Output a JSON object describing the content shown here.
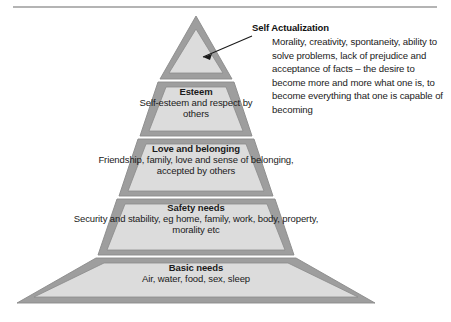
{
  "diagram": {
    "type": "maslow-hierarchy-of-needs-pyramid",
    "colors": {
      "frame": "#9e9e9e",
      "fill": "#dcdcdc",
      "outline": "#8a8a8a",
      "text": "#1a1a1a",
      "rule": "#b4b4b4",
      "background": "#ffffff"
    }
  },
  "callout": {
    "title": "Self Actualization",
    "body": "Morality, creativity, spontaneity, ability to solve problems, lack of prejudice and acceptance of facts – the desire to become more and more what one is, to become everything that one is capable of becoming"
  },
  "tiers": [
    {
      "id": "self-actualization",
      "level": 5,
      "title": "",
      "description": ""
    },
    {
      "id": "esteem",
      "level": 4,
      "title": "Esteem",
      "description": "Self-esteem and respect by others"
    },
    {
      "id": "love-and-belonging",
      "level": 3,
      "title": "Love and belonging",
      "description": "Friendship, family, love and sense of belonging, accepted by others"
    },
    {
      "id": "safety-needs",
      "level": 2,
      "title": "Safety needs",
      "description": "Security and stability, eg home, family, work, body, property, morality etc"
    },
    {
      "id": "basic-needs",
      "level": 1,
      "title": "Basic needs",
      "description": "Air, water, food, sex, sleep"
    }
  ]
}
